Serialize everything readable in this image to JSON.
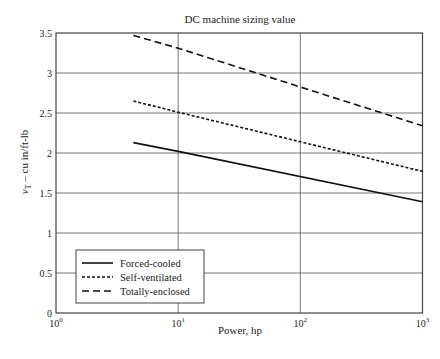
{
  "chart_data": {
    "type": "line",
    "title": "DC machine sizing value",
    "xlabel": "Power, hp",
    "ylabel": "v_T – cu in/ft-lb",
    "ylabel_main": "v",
    "ylabel_sub": "T",
    "ylabel_rest": " – cu in/ft-lb",
    "xscale": "log",
    "xlim": [
      1,
      1000
    ],
    "ylim": [
      0,
      3.5
    ],
    "grid": true,
    "xticks": [
      1,
      10,
      100,
      1000
    ],
    "xtick_labels": [
      {
        "base": "10",
        "exp": "0"
      },
      {
        "base": "10",
        "exp": "1"
      },
      {
        "base": "10",
        "exp": "2"
      },
      {
        "base": "10",
        "exp": "3"
      }
    ],
    "yticks": [
      0,
      0.5,
      1,
      1.5,
      2,
      2.5,
      3,
      3.5
    ],
    "ytick_labels": [
      "0",
      "0.5",
      "1",
      "1.5",
      "2",
      "2.5",
      "3",
      "3.5"
    ],
    "legend_position": "lower left",
    "series": [
      {
        "name": "Forced-cooled",
        "style": "solid",
        "x": [
          4.3,
          10,
          1000
        ],
        "y": [
          2.13,
          2.02,
          1.39
        ]
      },
      {
        "name": "Self-ventilated",
        "style": "dotted-dash",
        "x": [
          4.3,
          10,
          1000
        ],
        "y": [
          2.65,
          2.51,
          1.77
        ]
      },
      {
        "name": "Totally-enclosed",
        "style": "dashed",
        "x": [
          4.3,
          10,
          1000
        ],
        "y": [
          3.47,
          3.31,
          2.34
        ]
      }
    ]
  }
}
